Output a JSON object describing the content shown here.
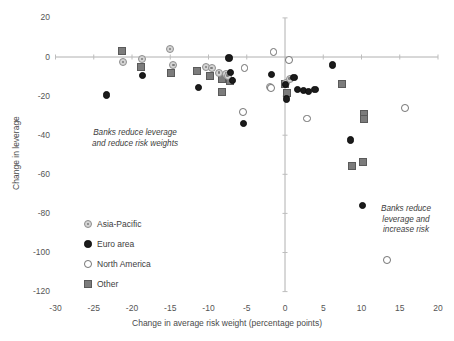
{
  "chart_data": {
    "type": "scatter",
    "title": "",
    "xlabel": "Change in average risk weight (percentage points)",
    "ylabel": "Change in leverage",
    "xlim": [
      -30,
      20
    ],
    "ylim": [
      -120,
      20
    ],
    "xticks": [
      -30,
      -25,
      -20,
      -15,
      -10,
      -5,
      0,
      5,
      10,
      15,
      20
    ],
    "xtick_labels": [
      "-30",
      "-25",
      "-20",
      "-15",
      "-10",
      "-5",
      "0",
      "5",
      "10",
      "15",
      "20"
    ],
    "yticks": [
      20,
      0,
      -20,
      -40,
      -60,
      -80,
      -100,
      -120
    ],
    "ytick_labels": [
      "20",
      "0",
      "-20",
      "-40",
      "-60",
      "-80",
      "-100",
      "-120"
    ],
    "grid": false,
    "legend_position": "lower-left-inside",
    "zero_lines": {
      "x": 0,
      "y": 0
    },
    "annotations": [
      {
        "name": "annotation-left",
        "text": "Banks reduce leverage\nand reduce risk weights",
        "x": -21.5,
        "y": -43
      },
      {
        "name": "annotation-right",
        "text": "Banks reduce\nleverage and\nincrease risk",
        "x": 13.5,
        "y": -82
      }
    ],
    "series": [
      {
        "name": "Asia-Pacific",
        "marker": "circle-dotted-gray",
        "color": "#d4d4d4",
        "edge_color": "#8e8e8e",
        "points": [
          [
            -21.2,
            -2.5
          ],
          [
            -18.7,
            -1.0
          ],
          [
            -15.0,
            4.0
          ],
          [
            -14.6,
            -4.0
          ],
          [
            -10.3,
            -5.0
          ],
          [
            -9.6,
            -5.5
          ],
          [
            -8.6,
            -8.0
          ],
          [
            -7.7,
            -8.5
          ],
          [
            -7.5,
            -9.5
          ],
          [
            -1.9,
            -15.5
          ],
          [
            0.1,
            -13.5
          ],
          [
            0.6,
            -11.0
          ]
        ]
      },
      {
        "name": "Euro area",
        "marker": "circle-filled-black",
        "color": "#1b1b1b",
        "edge_color": "#0d0d0d",
        "points": [
          [
            -23.3,
            -19.5
          ],
          [
            -18.6,
            -9.5
          ],
          [
            -11.3,
            -15.5
          ],
          [
            -7.3,
            -0.5
          ],
          [
            -7.1,
            -8.0
          ],
          [
            -6.9,
            -12.0
          ],
          [
            -5.4,
            -34.0
          ],
          [
            -1.8,
            -9.0
          ],
          [
            0.1,
            -14.0
          ],
          [
            0.2,
            -21.5
          ],
          [
            1.2,
            -10.5
          ],
          [
            1.6,
            -16.5
          ],
          [
            2.4,
            -17.0
          ],
          [
            3.1,
            -17.5
          ],
          [
            3.9,
            -16.5
          ],
          [
            6.2,
            -4.0
          ],
          [
            8.6,
            -42.5
          ],
          [
            10.1,
            -76.0
          ]
        ]
      },
      {
        "name": "North America",
        "marker": "circle-open",
        "color": "#ffffff",
        "edge_color": "#6f6f6f",
        "points": [
          [
            -5.3,
            -5.5
          ],
          [
            -5.5,
            -28.0
          ],
          [
            -1.8,
            -16.0
          ],
          [
            -1.5,
            2.5
          ],
          [
            0.5,
            -1.5
          ],
          [
            2.9,
            -31.5
          ],
          [
            13.3,
            -104.0
          ],
          [
            15.7,
            -26.0
          ]
        ]
      },
      {
        "name": "Other",
        "marker": "square-gray",
        "color": "#7c7c7c",
        "edge_color": "#5a5a5a",
        "points": [
          [
            -21.3,
            3.0
          ],
          [
            -18.8,
            -5.0
          ],
          [
            -14.9,
            -8.0
          ],
          [
            -11.5,
            -7.0
          ],
          [
            -9.8,
            -9.5
          ],
          [
            -8.3,
            -11.5
          ],
          [
            -8.2,
            -18.0
          ],
          [
            -7.2,
            -12.5
          ],
          [
            0.0,
            -14.0
          ],
          [
            0.2,
            -18.5
          ],
          [
            7.4,
            -14.0
          ],
          [
            10.3,
            -29.0
          ],
          [
            10.3,
            -31.5
          ],
          [
            8.7,
            -56.0
          ],
          [
            10.2,
            -53.5
          ]
        ]
      }
    ]
  },
  "legend": {
    "items": [
      {
        "label": "Asia-Pacific",
        "marker": "circle-dotted-gray"
      },
      {
        "label": "Euro area",
        "marker": "circle-filled-black"
      },
      {
        "label": "North America",
        "marker": "circle-open"
      },
      {
        "label": "Other",
        "marker": "square-gray"
      }
    ]
  }
}
